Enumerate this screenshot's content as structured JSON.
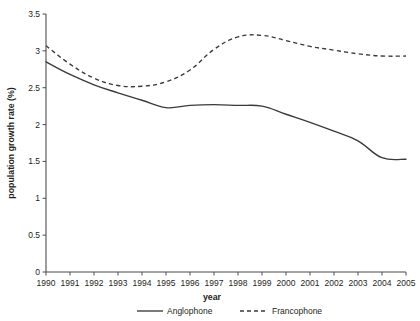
{
  "chart_data": {
    "type": "line",
    "title": "",
    "xlabel": "year",
    "ylabel": "population growth rate (%)",
    "x": [
      1990,
      1991,
      1992,
      1993,
      1994,
      1995,
      1996,
      1997,
      1998,
      1999,
      2000,
      2001,
      2002,
      2003,
      2004,
      2005
    ],
    "categories": [
      "1990",
      "1991",
      "1992",
      "1993",
      "1994",
      "1995",
      "1996",
      "1997",
      "1998",
      "1999",
      "2000",
      "2001",
      "2002",
      "2003",
      "2004",
      "2005"
    ],
    "series": [
      {
        "name": "Anglophone",
        "style": "solid",
        "values": [
          2.85,
          2.68,
          2.54,
          2.43,
          2.33,
          2.23,
          2.26,
          2.27,
          2.26,
          2.25,
          2.14,
          2.03,
          1.91,
          1.78,
          1.55,
          1.53
        ]
      },
      {
        "name": "Francophone",
        "style": "dashed",
        "values": [
          3.07,
          2.82,
          2.63,
          2.53,
          2.52,
          2.58,
          2.74,
          3.02,
          3.19,
          3.21,
          3.14,
          3.06,
          3.01,
          2.96,
          2.93,
          2.93
        ]
      }
    ],
    "ylim": [
      0,
      3.5
    ],
    "yticks": [
      "0",
      "0.5",
      "1",
      "1.5",
      "2",
      "2.5",
      "3",
      "3.5"
    ],
    "ytick_values": [
      0,
      0.5,
      1,
      1.5,
      2,
      2.5,
      3,
      3.5
    ],
    "xlim": [
      1990,
      2005
    ],
    "grid": false,
    "legend_position": "bottom",
    "legend": [
      {
        "label": "Anglophone",
        "style": "solid"
      },
      {
        "label": "Francophone",
        "style": "dashed"
      }
    ],
    "line_color": "#3a3a3a",
    "axis_color": "#4d4d4d"
  }
}
